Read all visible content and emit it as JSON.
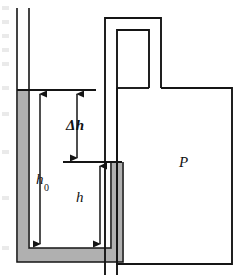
{
  "figure": {
    "width": 239,
    "height": 275,
    "background": "#ffffff",
    "line_color": "#151515",
    "fill_color": "#b0b0b0"
  },
  "labels": {
    "delta_h": "Δh",
    "h_zero_base": "h",
    "h_zero_sub": "0",
    "h": "h",
    "pressure": "P"
  },
  "components": {
    "left_tube": "open-capillary-tube",
    "u_tube": "mercury-u-tube",
    "connector": "inverted-u-connector",
    "vessel": "pressure-vessel"
  },
  "annotations": [
    {
      "name": "delta-h",
      "text": "Δh",
      "meaning": "height difference between mercury levels"
    },
    {
      "name": "h-zero",
      "text": "h0",
      "meaning": "height of left column above base"
    },
    {
      "name": "h",
      "text": "h",
      "meaning": "height of right column above base"
    },
    {
      "name": "P",
      "text": "P",
      "meaning": "pressure inside vessel"
    }
  ]
}
